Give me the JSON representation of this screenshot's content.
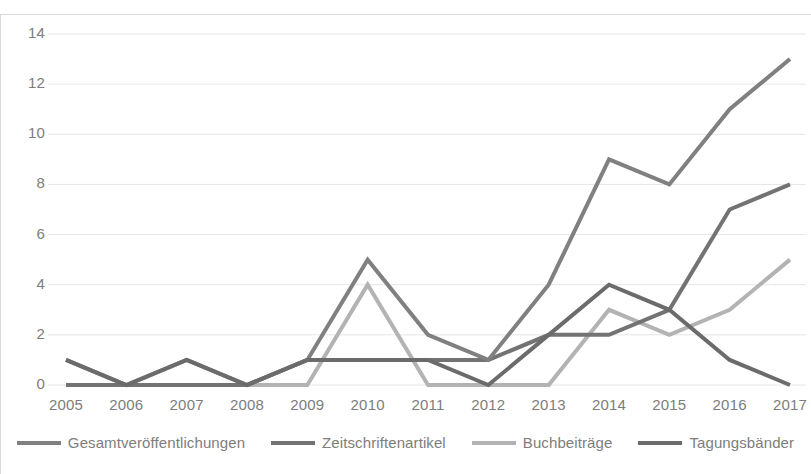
{
  "chart_data": {
    "type": "line",
    "title": "",
    "xlabel": "",
    "ylabel": "",
    "categories": [
      "2005",
      "2006",
      "2007",
      "2008",
      "2009",
      "2010",
      "2011",
      "2012",
      "2013",
      "2014",
      "2015",
      "2016",
      "2017"
    ],
    "ylim": [
      0,
      14
    ],
    "yticks": [
      0,
      2,
      4,
      6,
      8,
      10,
      12,
      14
    ],
    "grid": true,
    "legend_position": "bottom",
    "series": [
      {
        "name": "Gesamtveröffentlichungen",
        "color": "#808080",
        "values": [
          1,
          0,
          1,
          0,
          1,
          5,
          2,
          1,
          4,
          9,
          8,
          11,
          13
        ]
      },
      {
        "name": "Zeitschriftenartikel",
        "color": "#737373",
        "values": [
          0,
          0,
          0,
          0,
          1,
          1,
          1,
          1,
          2,
          2,
          3,
          7,
          8
        ]
      },
      {
        "name": "Buchbeiträge",
        "color": "#b3b3b3",
        "values": [
          0,
          0,
          0,
          0,
          0,
          4,
          0,
          0,
          0,
          3,
          2,
          3,
          5
        ]
      },
      {
        "name": "Tagungsbänder",
        "color": "#6b6b6b",
        "values": [
          1,
          0,
          1,
          0,
          1,
          1,
          1,
          0,
          2,
          4,
          3,
          1,
          0
        ]
      }
    ]
  },
  "axis": {
    "y_labels": [
      "14",
      "12",
      "10",
      "8",
      "6",
      "4",
      "2",
      "0"
    ],
    "x_labels": [
      "2005",
      "2006",
      "2007",
      "2008",
      "2009",
      "2010",
      "2011",
      "2012",
      "2013",
      "2014",
      "2015",
      "2016",
      "2017"
    ]
  },
  "legend": {
    "items": [
      {
        "label": "Gesamtveröffentlichungen",
        "color": "#808080"
      },
      {
        "label": "Zeitschriftenartikel",
        "color": "#737373"
      },
      {
        "label": "Buchbeiträge",
        "color": "#b3b3b3"
      },
      {
        "label": "Tagungsbänder",
        "color": "#6b6b6b"
      }
    ]
  },
  "grid_color": "#e6e6e6"
}
